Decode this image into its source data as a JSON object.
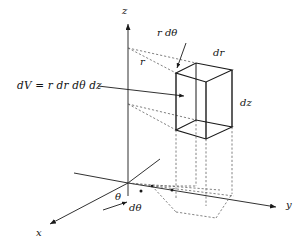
{
  "figure": {
    "background_color": "#ffffff",
    "stroke_color": "#1a1a1a",
    "dashed_color": "#555555",
    "formula": "dV = r dr dθ dz",
    "axes": {
      "x_label": "x",
      "y_label": "y",
      "z_label": "z"
    },
    "labels": {
      "r": "r",
      "r_dtheta": "r dθ",
      "dr": "dr",
      "dz": "dz",
      "theta": "θ",
      "dtheta": "dθ"
    },
    "annotations": [
      {
        "name": "formula-leader",
        "text": "dV = r dr dθ dz",
        "points_to": "volume-element-box"
      },
      {
        "name": "r-dtheta-leader",
        "text": "r dθ",
        "points_to": "box-top-front-edge"
      }
    ]
  },
  "geometry": {
    "origin": {
      "x": 128,
      "y": 183
    },
    "z_axis_top": {
      "x": 128,
      "y": 22
    },
    "y_axis_end": {
      "x": 280,
      "y": 207
    },
    "x_axis_end": {
      "x": 46,
      "y": 226
    },
    "box_corners": {
      "top_front_left": {
        "x": 176,
        "y": 73
      },
      "top_front_right": {
        "x": 206,
        "y": 82
      },
      "top_back_left": {
        "x": 196,
        "y": 63
      },
      "top_back_right": {
        "x": 232,
        "y": 70
      },
      "bottom_front_left": {
        "x": 176,
        "y": 130
      },
      "bottom_front_right": {
        "x": 206,
        "y": 139
      },
      "bottom_back_left": {
        "x": 196,
        "y": 120
      },
      "bottom_back_right": {
        "x": 232,
        "y": 127
      }
    }
  }
}
